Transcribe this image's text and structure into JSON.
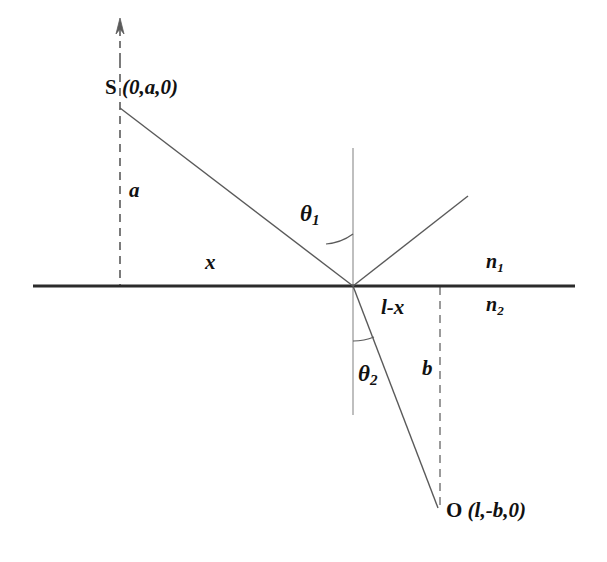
{
  "figure": {
    "type": "optics-refraction-reflection-diagram",
    "background_color": "#ffffff",
    "line_color": "#5a5a5a",
    "interface_color": "#2b2b2b",
    "text_color": "#111111"
  },
  "labels": {
    "source_point_name": "S",
    "source_point_coords": "(0,a,0)",
    "observer_point_name": "O",
    "observer_point_coords": "(l,-b,0)",
    "height_above": "a",
    "depth_below": "b",
    "horizontal_left": "x",
    "horizontal_right": "l-x",
    "angle_incidence_symbol": "θ",
    "angle_incidence_sub": "1",
    "angle_refraction_symbol": "θ",
    "angle_refraction_sub": "2",
    "index_upper_symbol": "n",
    "index_upper_sub": "1",
    "index_lower_symbol": "n",
    "index_lower_sub": "2"
  },
  "geometry": {
    "interface_y": 286,
    "interface_x_start": 33,
    "interface_x_end": 575,
    "incidence_point_x": 353,
    "normal_top_y": 148,
    "normal_bottom_y": 415,
    "source_x": 120,
    "source_ray_start_y": 108,
    "observer_x": 438,
    "observer_y": 508,
    "reflected_end_x": 468,
    "reflected_end_y": 196,
    "arrow_tip_y": 20
  }
}
